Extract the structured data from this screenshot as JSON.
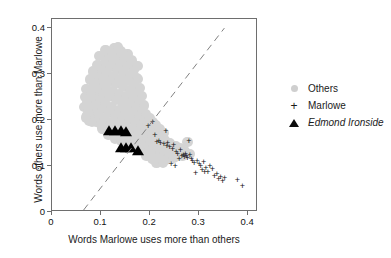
{
  "chart_data": {
    "type": "scatter",
    "title": "",
    "xlabel": "Words Marlowe uses more than others",
    "ylabel": "Words others use more than Marlowe",
    "xlim": [
      0,
      0.42
    ],
    "ylim": [
      0,
      0.42
    ],
    "xticks": [
      "0",
      "0.1",
      "0.2",
      "0.3",
      "0.4"
    ],
    "xtick_values": [
      0,
      0.1,
      0.2,
      0.3,
      0.4
    ],
    "yticks": [
      "0",
      "0.1",
      "0.2",
      "0.3",
      "0.4"
    ],
    "ytick_values": [
      0,
      0.1,
      0.2,
      0.3,
      0.4
    ],
    "grid": false,
    "legend_position": "right",
    "reference_line": {
      "style": "dashed",
      "color": "#808080",
      "x0": 0.065,
      "y0": 0.0,
      "x1": 0.355,
      "y1": 0.4
    },
    "series": [
      {
        "name": "Others",
        "marker": "circle",
        "color": "#d4d4d4",
        "points": [
          [
            0.072,
            0.21
          ],
          [
            0.074,
            0.232
          ],
          [
            0.076,
            0.198
          ],
          [
            0.078,
            0.248
          ],
          [
            0.08,
            0.222
          ],
          [
            0.082,
            0.262
          ],
          [
            0.083,
            0.205
          ],
          [
            0.085,
            0.238
          ],
          [
            0.086,
            0.272
          ],
          [
            0.088,
            0.218
          ],
          [
            0.089,
            0.252
          ],
          [
            0.09,
            0.288
          ],
          [
            0.091,
            0.196
          ],
          [
            0.093,
            0.23
          ],
          [
            0.094,
            0.266
          ],
          [
            0.095,
            0.3
          ],
          [
            0.096,
            0.208
          ],
          [
            0.098,
            0.244
          ],
          [
            0.099,
            0.278
          ],
          [
            0.1,
            0.312
          ],
          [
            0.101,
            0.19
          ],
          [
            0.102,
            0.224
          ],
          [
            0.104,
            0.256
          ],
          [
            0.105,
            0.29
          ],
          [
            0.106,
            0.322
          ],
          [
            0.107,
            0.202
          ],
          [
            0.108,
            0.236
          ],
          [
            0.11,
            0.268
          ],
          [
            0.111,
            0.302
          ],
          [
            0.112,
            0.334
          ],
          [
            0.113,
            0.184
          ],
          [
            0.114,
            0.216
          ],
          [
            0.116,
            0.25
          ],
          [
            0.117,
            0.284
          ],
          [
            0.118,
            0.316
          ],
          [
            0.119,
            0.346
          ],
          [
            0.12,
            0.196
          ],
          [
            0.121,
            0.228
          ],
          [
            0.123,
            0.262
          ],
          [
            0.124,
            0.296
          ],
          [
            0.125,
            0.328
          ],
          [
            0.126,
            0.356
          ],
          [
            0.127,
            0.178
          ],
          [
            0.128,
            0.21
          ],
          [
            0.13,
            0.244
          ],
          [
            0.131,
            0.278
          ],
          [
            0.132,
            0.31
          ],
          [
            0.133,
            0.34
          ],
          [
            0.134,
            0.19
          ],
          [
            0.136,
            0.222
          ],
          [
            0.137,
            0.256
          ],
          [
            0.138,
            0.29
          ],
          [
            0.139,
            0.322
          ],
          [
            0.14,
            0.35
          ],
          [
            0.141,
            0.172
          ],
          [
            0.143,
            0.204
          ],
          [
            0.144,
            0.238
          ],
          [
            0.145,
            0.272
          ],
          [
            0.146,
            0.304
          ],
          [
            0.147,
            0.334
          ],
          [
            0.149,
            0.186
          ],
          [
            0.15,
            0.218
          ],
          [
            0.151,
            0.252
          ],
          [
            0.152,
            0.286
          ],
          [
            0.153,
            0.318
          ],
          [
            0.154,
            0.344
          ],
          [
            0.156,
            0.166
          ],
          [
            0.157,
            0.2
          ],
          [
            0.158,
            0.234
          ],
          [
            0.159,
            0.266
          ],
          [
            0.16,
            0.298
          ],
          [
            0.161,
            0.326
          ],
          [
            0.163,
            0.18
          ],
          [
            0.164,
            0.214
          ],
          [
            0.165,
            0.248
          ],
          [
            0.166,
            0.28
          ],
          [
            0.167,
            0.31
          ],
          [
            0.169,
            0.16
          ],
          [
            0.17,
            0.194
          ],
          [
            0.171,
            0.228
          ],
          [
            0.172,
            0.26
          ],
          [
            0.173,
            0.292
          ],
          [
            0.175,
            0.29
          ],
          [
            0.176,
            0.174
          ],
          [
            0.177,
            0.208
          ],
          [
            0.178,
            0.24
          ],
          [
            0.179,
            0.27
          ],
          [
            0.181,
            0.154
          ],
          [
            0.182,
            0.188
          ],
          [
            0.183,
            0.22
          ],
          [
            0.184,
            0.252
          ],
          [
            0.186,
            0.168
          ],
          [
            0.187,
            0.2
          ],
          [
            0.188,
            0.232
          ],
          [
            0.19,
            0.148
          ],
          [
            0.191,
            0.18
          ],
          [
            0.192,
            0.212
          ],
          [
            0.194,
            0.16
          ],
          [
            0.195,
            0.192
          ],
          [
            0.196,
            0.14
          ],
          [
            0.198,
            0.172
          ],
          [
            0.199,
            0.204
          ],
          [
            0.2,
            0.152
          ],
          [
            0.202,
            0.184
          ],
          [
            0.203,
            0.132
          ],
          [
            0.204,
            0.164
          ],
          [
            0.206,
            0.196
          ],
          [
            0.207,
            0.144
          ],
          [
            0.208,
            0.176
          ],
          [
            0.21,
            0.126
          ],
          [
            0.211,
            0.158
          ],
          [
            0.212,
            0.188
          ],
          [
            0.214,
            0.138
          ],
          [
            0.215,
            0.168
          ],
          [
            0.216,
            0.12
          ],
          [
            0.218,
            0.15
          ],
          [
            0.219,
            0.18
          ],
          [
            0.22,
            0.13
          ],
          [
            0.222,
            0.162
          ],
          [
            0.224,
            0.118
          ],
          [
            0.225,
            0.146
          ],
          [
            0.227,
            0.172
          ],
          [
            0.229,
            0.128
          ],
          [
            0.231,
            0.156
          ],
          [
            0.233,
            0.114
          ],
          [
            0.235,
            0.14
          ],
          [
            0.238,
            0.124
          ],
          [
            0.241,
            0.15
          ],
          [
            0.244,
            0.134
          ],
          [
            0.248,
            0.118
          ],
          [
            0.252,
            0.144
          ],
          [
            0.256,
            0.128
          ],
          [
            0.261,
            0.138
          ],
          [
            0.266,
            0.122
          ],
          [
            0.271,
            0.132
          ],
          [
            0.276,
            0.152
          ],
          [
            0.281,
            0.126
          ],
          [
            0.066,
            0.228
          ],
          [
            0.068,
            0.25
          ],
          [
            0.07,
            0.268
          ],
          [
            0.077,
            0.288
          ],
          [
            0.084,
            0.306
          ],
          [
            0.092,
            0.32
          ],
          [
            0.103,
            0.182
          ],
          [
            0.115,
            0.168
          ],
          [
            0.129,
            0.16
          ],
          [
            0.142,
            0.154
          ],
          [
            0.155,
            0.148
          ],
          [
            0.168,
            0.142
          ],
          [
            0.18,
            0.136
          ],
          [
            0.193,
            0.122
          ],
          [
            0.205,
            0.116
          ],
          [
            0.213,
            0.108
          ],
          [
            0.221,
            0.112
          ],
          [
            0.226,
            0.106
          ],
          [
            0.097,
            0.34
          ],
          [
            0.109,
            0.352
          ],
          [
            0.122,
            0.344
          ],
          [
            0.135,
            0.358
          ],
          [
            0.148,
            0.338
          ],
          [
            0.162,
            0.33
          ],
          [
            0.174,
            0.318
          ],
          [
            0.071,
            0.24
          ],
          [
            0.079,
            0.258
          ],
          [
            0.087,
            0.278
          ],
          [
            0.075,
            0.214
          ],
          [
            0.081,
            0.196
          ],
          [
            0.073,
            0.222
          ],
          [
            0.069,
            0.206
          ]
        ]
      },
      {
        "name": "Marlowe",
        "marker": "plus",
        "color": "#111111",
        "points": [
          [
            0.196,
            0.188
          ],
          [
            0.205,
            0.196
          ],
          [
            0.21,
            0.168
          ],
          [
            0.214,
            0.152
          ],
          [
            0.218,
            0.154
          ],
          [
            0.221,
            0.15
          ],
          [
            0.228,
            0.148
          ],
          [
            0.232,
            0.176
          ],
          [
            0.234,
            0.144
          ],
          [
            0.236,
            0.15
          ],
          [
            0.24,
            0.142
          ],
          [
            0.243,
            0.104
          ],
          [
            0.246,
            0.138
          ],
          [
            0.248,
            0.146
          ],
          [
            0.251,
            0.1
          ],
          [
            0.253,
            0.13
          ],
          [
            0.256,
            0.126
          ],
          [
            0.259,
            0.116
          ],
          [
            0.262,
            0.134
          ],
          [
            0.265,
            0.122
          ],
          [
            0.268,
            0.124
          ],
          [
            0.27,
            0.12
          ],
          [
            0.272,
            0.126
          ],
          [
            0.274,
            0.122
          ],
          [
            0.276,
            0.118
          ],
          [
            0.279,
            0.154
          ],
          [
            0.281,
            0.124
          ],
          [
            0.284,
            0.116
          ],
          [
            0.286,
            0.112
          ],
          [
            0.29,
            0.106
          ],
          [
            0.293,
            0.084
          ],
          [
            0.296,
            0.11
          ],
          [
            0.3,
            0.104
          ],
          [
            0.303,
            0.1
          ],
          [
            0.306,
            0.092
          ],
          [
            0.309,
            0.108
          ],
          [
            0.311,
            0.086
          ],
          [
            0.314,
            0.096
          ],
          [
            0.318,
            0.088
          ],
          [
            0.322,
            0.1
          ],
          [
            0.327,
            0.094
          ],
          [
            0.331,
            0.078
          ],
          [
            0.336,
            0.082
          ],
          [
            0.34,
            0.072
          ],
          [
            0.344,
            0.076
          ],
          [
            0.348,
            0.068
          ],
          [
            0.352,
            0.074
          ],
          [
            0.378,
            0.07
          ],
          [
            0.388,
            0.056
          ]
        ]
      },
      {
        "name": "Edmond Ironside",
        "marker": "triangle",
        "color": "#000000",
        "points": [
          [
            0.117,
            0.171
          ],
          [
            0.128,
            0.172
          ],
          [
            0.14,
            0.171
          ],
          [
            0.151,
            0.17
          ],
          [
            0.14,
            0.136
          ],
          [
            0.151,
            0.135
          ],
          [
            0.162,
            0.134
          ],
          [
            0.176,
            0.128
          ]
        ]
      }
    ]
  },
  "legend": {
    "items": [
      {
        "label": "Others",
        "marker": "circle-icon",
        "italic": false
      },
      {
        "label": "Marlowe",
        "marker": "plus-icon",
        "italic": false
      },
      {
        "label": "Edmond Ironside",
        "marker": "triangle-icon",
        "italic": true
      }
    ]
  }
}
